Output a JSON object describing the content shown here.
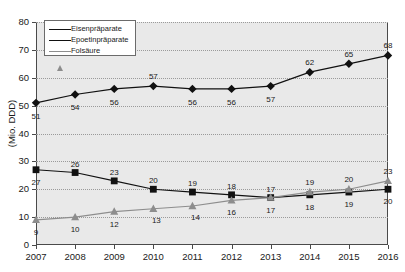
{
  "chart_data": {
    "type": "line",
    "title": "",
    "xlabel": "",
    "ylabel": "(Mio. DDD)",
    "categories": [
      "2007",
      "2008",
      "2009",
      "2010",
      "2011",
      "2012",
      "2013",
      "2014",
      "2015",
      "2016"
    ],
    "ylim": [
      0,
      80
    ],
    "yticks": [
      0,
      10,
      20,
      30,
      40,
      50,
      60,
      70,
      80
    ],
    "grid": true,
    "legend_position": "top-left",
    "series": [
      {
        "name": "Eisenpräparate",
        "marker": "diamond",
        "color": "#111111",
        "line_style": "solid",
        "values": [
          51,
          54,
          56,
          57,
          56,
          56,
          57,
          62,
          65,
          68
        ]
      },
      {
        "name": "Epoetinpräparate",
        "marker": "square",
        "color": "#111111",
        "line_style": "solid",
        "values": [
          27,
          26,
          23,
          20,
          19,
          18,
          17,
          18,
          19,
          20
        ]
      },
      {
        "name": "Folsäure",
        "marker": "triangle",
        "color": "#8d8d8d",
        "line_style": "solid",
        "values": [
          9,
          10,
          12,
          13,
          14,
          16,
          17,
          19,
          20,
          23
        ]
      }
    ]
  },
  "axes": {
    "y_title": "(Mio. DDD)",
    "y_tick_labels": [
      "0",
      "10",
      "20",
      "30",
      "40",
      "50",
      "60",
      "70",
      "80"
    ],
    "x_tick_labels": [
      "2007",
      "2008",
      "2009",
      "2010",
      "2011",
      "2012",
      "2013",
      "2014",
      "2015",
      "2016"
    ]
  },
  "legend": {
    "items": [
      {
        "label": "Eisenpräparate"
      },
      {
        "label": "Epoetinpräparate"
      },
      {
        "label": "Folsäure"
      }
    ]
  },
  "colors": {
    "plot_background": "#e9e9e9",
    "axis": "#4a4a4a",
    "grid": "#9a9a9a",
    "series_dark": "#111111",
    "series_gray": "#8d8d8d",
    "page_background": "#ffffff"
  }
}
